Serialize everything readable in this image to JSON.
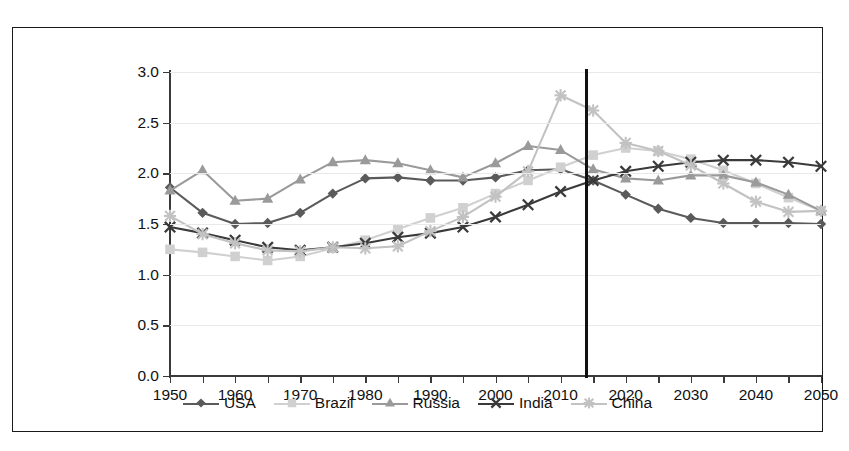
{
  "chart_data": {
    "type": "line",
    "title": "",
    "xlabel": "",
    "ylabel": "Ratio of working-age to non-working-age population",
    "xlim": [
      1950,
      2050
    ],
    "ylim": [
      0.0,
      3.0
    ],
    "grid": true,
    "legend_position": "bottom",
    "x": [
      1950,
      1955,
      1960,
      1965,
      1970,
      1975,
      1980,
      1985,
      1990,
      1995,
      2000,
      2005,
      2010,
      2015,
      2020,
      2025,
      2030,
      2035,
      2040,
      2045,
      2050
    ],
    "yticks": [
      "0.0",
      "0.5",
      "1.0",
      "1.5",
      "2.0",
      "2.5",
      "3.0"
    ],
    "ytick_values": [
      0.0,
      0.5,
      1.0,
      1.5,
      2.0,
      2.5,
      3.0
    ],
    "xticks_labeled": [
      "1950",
      "1960",
      "1970",
      "1980",
      "1990",
      "2000",
      "2010",
      "2020",
      "2030",
      "2040",
      "2050"
    ],
    "xticks_minor": [
      1955,
      1965,
      1975,
      1985,
      1995,
      2005,
      2015,
      2025,
      2035,
      2045
    ],
    "annotations": [
      {
        "name": "present-year-line",
        "type": "vertical-line",
        "x": 2014,
        "color": "#111111"
      }
    ],
    "series": [
      {
        "name": "USA",
        "marker": "diamond",
        "color": "#5a5a5a",
        "values": [
          1.86,
          1.61,
          1.5,
          1.51,
          1.61,
          1.8,
          1.95,
          1.96,
          1.93,
          1.93,
          1.96,
          2.03,
          2.04,
          1.93,
          1.79,
          1.65,
          1.56,
          1.51,
          1.51,
          1.51,
          1.5
        ]
      },
      {
        "name": "Brazil",
        "marker": "square",
        "color": "#d0d0d0",
        "values": [
          1.25,
          1.22,
          1.18,
          1.14,
          1.18,
          1.26,
          1.34,
          1.45,
          1.56,
          1.66,
          1.8,
          1.93,
          2.06,
          2.18,
          2.25,
          2.22,
          2.14,
          2.03,
          1.9,
          1.76,
          1.63
        ]
      },
      {
        "name": "Russia",
        "marker": "triangle",
        "color": "#9a9a9a",
        "values": [
          1.83,
          2.03,
          1.73,
          1.75,
          1.94,
          2.11,
          2.13,
          2.1,
          2.03,
          1.96,
          2.1,
          2.27,
          2.23,
          2.04,
          1.95,
          1.93,
          1.98,
          1.98,
          1.91,
          1.79,
          1.63
        ]
      },
      {
        "name": "India",
        "marker": "x",
        "color": "#3a3a3a",
        "values": [
          1.47,
          1.41,
          1.34,
          1.27,
          1.24,
          1.27,
          1.31,
          1.37,
          1.41,
          1.47,
          1.57,
          1.69,
          1.82,
          1.93,
          2.02,
          2.07,
          2.11,
          2.13,
          2.13,
          2.11,
          2.07
        ]
      },
      {
        "name": "China",
        "marker": "star",
        "color": "#c2c2c2",
        "values": [
          1.58,
          1.4,
          1.31,
          1.24,
          1.23,
          1.27,
          1.26,
          1.28,
          1.43,
          1.57,
          1.77,
          2.02,
          2.77,
          2.62,
          2.3,
          2.22,
          2.08,
          1.9,
          1.72,
          1.62,
          1.63
        ]
      }
    ]
  },
  "legend": {
    "items": [
      {
        "label": "USA"
      },
      {
        "label": "Brazil"
      },
      {
        "label": "Russia"
      },
      {
        "label": "India"
      },
      {
        "label": "China"
      }
    ]
  }
}
